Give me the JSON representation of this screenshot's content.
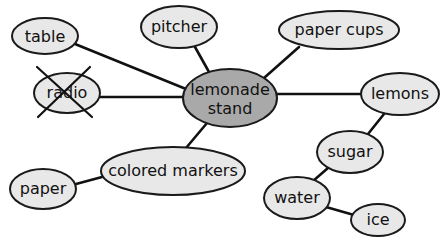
{
  "diagram": {
    "title": "lemonade stand",
    "colors": {
      "node_fill": "#e8e8e8",
      "center_fill": "#a9a9a9",
      "outline": "#1a1a1a",
      "edge": "#111111"
    },
    "center": {
      "id": "lemonade-stand",
      "line1": "lemonade",
      "line2": "stand",
      "cx": 230,
      "cy": 98,
      "rx": 47,
      "ry": 29
    },
    "nodes": [
      {
        "id": "table",
        "label": "table",
        "cx": 45,
        "cy": 36,
        "rx": 33,
        "ry": 18,
        "crossed_out": false
      },
      {
        "id": "pitcher",
        "label": "pitcher",
        "cx": 179,
        "cy": 27,
        "rx": 38,
        "ry": 21,
        "crossed_out": false
      },
      {
        "id": "paper-cups",
        "label": "paper cups",
        "cx": 339,
        "cy": 30,
        "rx": 60,
        "ry": 19,
        "crossed_out": false
      },
      {
        "id": "radio",
        "label": "radio",
        "cx": 67,
        "cy": 93,
        "rx": 33,
        "ry": 20,
        "crossed_out": true
      },
      {
        "id": "lemons",
        "label": "lemons",
        "cx": 400,
        "cy": 94,
        "rx": 39,
        "ry": 21,
        "crossed_out": false
      },
      {
        "id": "sugar",
        "label": "sugar",
        "cx": 350,
        "cy": 152,
        "rx": 33,
        "ry": 21,
        "crossed_out": false
      },
      {
        "id": "colored-markers",
        "label": "colored markers",
        "cx": 173,
        "cy": 171,
        "rx": 72,
        "ry": 24,
        "crossed_out": false
      },
      {
        "id": "paper",
        "label": "paper",
        "cx": 43,
        "cy": 189,
        "rx": 33,
        "ry": 20,
        "crossed_out": false
      },
      {
        "id": "water",
        "label": "water",
        "cx": 297,
        "cy": 198,
        "rx": 33,
        "ry": 21,
        "crossed_out": false
      },
      {
        "id": "ice",
        "label": "ice",
        "cx": 378,
        "cy": 220,
        "rx": 27,
        "ry": 16,
        "crossed_out": false
      }
    ],
    "edges": [
      {
        "from": "lemonade-stand",
        "to": "table"
      },
      {
        "from": "lemonade-stand",
        "to": "pitcher"
      },
      {
        "from": "lemonade-stand",
        "to": "paper-cups"
      },
      {
        "from": "lemonade-stand",
        "to": "radio"
      },
      {
        "from": "lemonade-stand",
        "to": "lemons"
      },
      {
        "from": "lemonade-stand",
        "to": "colored-markers"
      },
      {
        "from": "lemons",
        "to": "sugar"
      },
      {
        "from": "sugar",
        "to": "water"
      },
      {
        "from": "water",
        "to": "ice"
      },
      {
        "from": "colored-markers",
        "to": "paper"
      }
    ]
  }
}
